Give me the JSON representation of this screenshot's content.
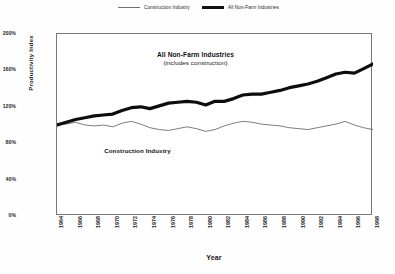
{
  "chart_data": {
    "type": "line",
    "title": "",
    "xlabel": "Year",
    "ylabel": "Productivity Index",
    "xlim": [
      1964,
      1998
    ],
    "ylim": [
      0,
      200
    ],
    "grid": false,
    "legend_position": "top-center",
    "y_ticks": [
      "200%",
      "160%",
      "120%",
      "80%",
      "40%",
      "0%"
    ],
    "y_tick_values": [
      200,
      160,
      120,
      80,
      40,
      0
    ],
    "x_ticks": [
      "1964",
      "1966",
      "1968",
      "1970",
      "1972",
      "1974",
      "1976",
      "1978",
      "1980",
      "1982",
      "1984",
      "1986",
      "1988",
      "1990",
      "1992",
      "1994",
      "1996",
      "1998"
    ],
    "x": [
      1964,
      1965,
      1966,
      1967,
      1968,
      1969,
      1970,
      1971,
      1972,
      1973,
      1974,
      1975,
      1976,
      1977,
      1978,
      1979,
      1980,
      1981,
      1982,
      1983,
      1984,
      1985,
      1986,
      1987,
      1988,
      1989,
      1990,
      1991,
      1992,
      1993,
      1994,
      1995,
      1996,
      1997,
      1998
    ],
    "series": [
      {
        "name": "Construction Industry",
        "style": "thin",
        "color": "#5a5a5a",
        "values": [
          100,
          101,
          103,
          100,
          99,
          100,
          98,
          102,
          104,
          101,
          97,
          95,
          94,
          96,
          98,
          96,
          93,
          95,
          99,
          102,
          104,
          103,
          101,
          100,
          99,
          97,
          96,
          95,
          97,
          99,
          101,
          104,
          100,
          97,
          95
        ]
      },
      {
        "name": "All Non-Farm Industries",
        "style": "thick",
        "color": "#0d0d0d",
        "values": [
          100,
          103,
          106,
          108,
          110,
          111,
          112,
          116,
          119,
          120,
          118,
          121,
          124,
          125,
          126,
          125,
          122,
          126,
          126,
          129,
          133,
          134,
          134,
          136,
          138,
          141,
          143,
          145,
          148,
          152,
          156,
          158,
          157,
          162,
          167
        ]
      }
    ],
    "annotations": [
      {
        "id": "nonfarm",
        "line1": "All Non-Farm Industries",
        "line2": "(includes construction)"
      },
      {
        "id": "construction",
        "line1": "Construction Industry"
      }
    ]
  },
  "legend": {
    "entries": [
      {
        "label": "Construction Industry",
        "style": "thin"
      },
      {
        "label": "All Non-Farm Industries",
        "style": "thick"
      }
    ]
  }
}
